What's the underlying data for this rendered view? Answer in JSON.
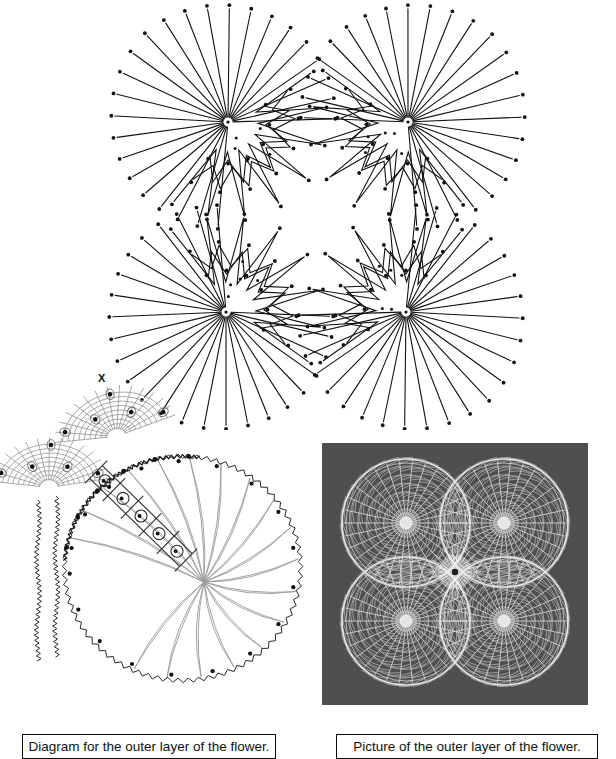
{
  "page": {
    "width": 616,
    "height": 759,
    "background": "#ffffff"
  },
  "captions": {
    "diagram": "Diagram for the outer layer of the flower.",
    "picture": "Picture of the outer layer of the flower."
  },
  "labels": {
    "x_marker": "X"
  },
  "colors": {
    "ink": "#111111",
    "thread_grey": "#9a9a9a",
    "outline_dark": "#2b2b2b",
    "photo_background": "#4e4e4e",
    "photo_thread": "#f2f2f2",
    "paper": "#ffffff"
  },
  "pattern_figure": {
    "name": "pricking-pattern",
    "description": "Four-petal starburst pricking: radiating zigzag thread lines with pin dots",
    "view": {
      "width": 616,
      "height": 430
    },
    "centers": [
      {
        "id": "top-left",
        "cx": 228,
        "cy": 122
      },
      {
        "id": "top-right",
        "cx": 408,
        "cy": 122
      },
      {
        "id": "bottom-left",
        "cx": 226,
        "cy": 312
      },
      {
        "id": "bottom-right",
        "cx": 406,
        "cy": 312
      }
    ],
    "outer_rays": 24,
    "outer_radius_min": 92,
    "outer_radius_max": 118,
    "inner_zigzag_rings": 3,
    "pin_dot_radius": 1.9,
    "line_width": 1.1,
    "centre_gap_radius": 26
  },
  "diagram_figure": {
    "name": "petal-working-diagram",
    "description": "Working diagram of a single petal: wavy outline, grey radiating threads, grey mesh lobes, numbered pin loops along a diagonal braid",
    "view": {
      "width": 310,
      "height": 355
    },
    "petal": {
      "center_x": 178,
      "center_y": 204,
      "radius_x": 118,
      "radius_y": 112,
      "wave_amplitude": 2.2,
      "wave_count": 150
    },
    "fan_threads": 17,
    "edge_pins": 18,
    "braid_pins": 5,
    "mesh_lobes": 2
  },
  "photo_figure": {
    "name": "lace-photograph",
    "description": "Photograph of finished white lace flower: four round petals on dark grey cloth",
    "view": {
      "width": 266,
      "height": 262
    },
    "petals": [
      {
        "id": "upper-left",
        "cx": 84,
        "cy": 80,
        "r": 64
      },
      {
        "id": "upper-right",
        "cx": 182,
        "cy": 80,
        "r": 64
      },
      {
        "id": "lower-left",
        "cx": 84,
        "cy": 178,
        "r": 64
      },
      {
        "id": "lower-right",
        "cx": 182,
        "cy": 178,
        "r": 64
      }
    ],
    "spokes_per_petal": 30,
    "arc_rings": 7
  }
}
